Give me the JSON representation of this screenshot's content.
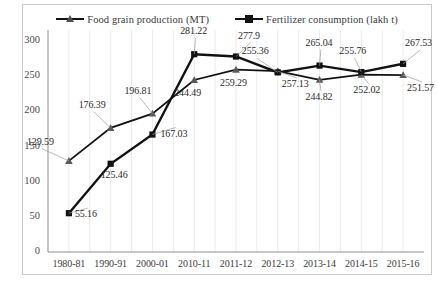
{
  "chart_data": {
    "type": "line",
    "title": "",
    "xlabel": "",
    "ylabel": "",
    "categories": [
      "1980-81",
      "1990-91",
      "2000-01",
      "2010-11",
      "2011-12",
      "2012-13",
      "2013-14",
      "2014-15",
      "2015-16"
    ],
    "ylim": [
      0,
      300
    ],
    "yticks": [
      0,
      50,
      100,
      150,
      200,
      250,
      300
    ],
    "grid": "vertical",
    "legend_position": "top-center",
    "series": [
      {
        "name": "Food grain production (MT)",
        "marker": "triangle",
        "color": "#121212",
        "values": [
          129.59,
          176.39,
          196.81,
          244.49,
          259.29,
          257.13,
          244.82,
          252.02,
          251.57
        ],
        "labels": [
          "129.59",
          "176.39",
          "196.81",
          "244.49",
          "259.29",
          "257.13",
          "244.82",
          "252.02",
          "251.57"
        ]
      },
      {
        "name": "Fertilizer consumption (lakh t)",
        "marker": "square",
        "color": "#121212",
        "values": [
          55.16,
          125.46,
          167.03,
          281.22,
          277.9,
          255.36,
          265.04,
          255.76,
          267.53
        ],
        "labels": [
          "55.16",
          "125.46",
          "167.03",
          "281.22",
          "277.9",
          "255.36",
          "265.04",
          "255.76",
          "267.53"
        ]
      }
    ]
  },
  "legend": {
    "items": [
      {
        "label": "Food grain production (MT)"
      },
      {
        "label": "Fertilizer consumption (lakh t)"
      }
    ]
  },
  "axis": {
    "y_labels": [
      "300",
      "250",
      "200",
      "150",
      "100",
      "50",
      "0"
    ],
    "x_labels": [
      "1980-81",
      "1990-91",
      "2000-01",
      "2010-11",
      "2011-12",
      "2012-13",
      "2013-14",
      "2014-15",
      "2015-16"
    ]
  }
}
